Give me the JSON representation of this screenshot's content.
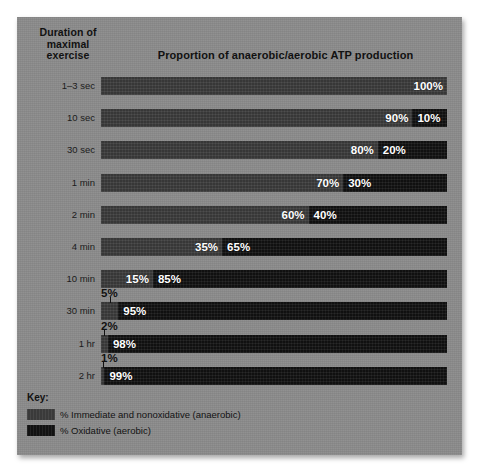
{
  "headings": {
    "duration": "Duration of\nmaximal\nexercise",
    "title": "Proportion of anaerobic/aerobic ATP production"
  },
  "legend": {
    "title": "Key:",
    "items": [
      {
        "swatch": "anaerobic",
        "label": "% Immediate and nonoxidative (anaerobic)"
      },
      {
        "swatch": "aerobic",
        "label": "% Oxidative (aerobic)"
      }
    ]
  },
  "colors": {
    "panel_background": "#8b8b8b",
    "anaerobic": "#3d3d3d",
    "aerobic": "#141414",
    "value_text": "#ffffff",
    "label_text": "#1b1b1b"
  },
  "chart_data": {
    "type": "bar",
    "orientation": "horizontal",
    "stacked": true,
    "title": "Proportion of anaerobic/aerobic ATP production",
    "xlabel": "",
    "ylabel": "Duration of maximal exercise",
    "xlim": [
      0,
      100
    ],
    "grid": false,
    "legend_position": "bottom-left",
    "categories": [
      "1–3 sec",
      "10 sec",
      "30 sec",
      "1 min",
      "2 min",
      "4 min",
      "10 min",
      "30 min",
      "1 hr",
      "2 hr"
    ],
    "series": [
      {
        "name": "% Immediate and nonoxidative (anaerobic)",
        "color": "#3d3d3d",
        "values": [
          100,
          90,
          80,
          70,
          60,
          35,
          15,
          5,
          2,
          1
        ]
      },
      {
        "name": "% Oxidative (aerobic)",
        "color": "#141414",
        "values": [
          0,
          10,
          20,
          30,
          40,
          65,
          85,
          95,
          98,
          99
        ]
      }
    ],
    "rows": [
      {
        "category": "1–3 sec",
        "anaerobic": 100,
        "aerobic": 0,
        "anaerobic_label": "100%",
        "aerobic_label": "",
        "callout": null
      },
      {
        "category": "10 sec",
        "anaerobic": 90,
        "aerobic": 10,
        "anaerobic_label": "90%",
        "aerobic_label": "10%",
        "callout": null
      },
      {
        "category": "30 sec",
        "anaerobic": 80,
        "aerobic": 20,
        "anaerobic_label": "80%",
        "aerobic_label": "20%",
        "callout": null
      },
      {
        "category": "1 min",
        "anaerobic": 70,
        "aerobic": 30,
        "anaerobic_label": "70%",
        "aerobic_label": "30%",
        "callout": null
      },
      {
        "category": "2 min",
        "anaerobic": 60,
        "aerobic": 40,
        "anaerobic_label": "60%",
        "aerobic_label": "40%",
        "callout": null
      },
      {
        "category": "4 min",
        "anaerobic": 35,
        "aerobic": 65,
        "anaerobic_label": "35%",
        "aerobic_label": "65%",
        "callout": null
      },
      {
        "category": "10 min",
        "anaerobic": 15,
        "aerobic": 85,
        "anaerobic_label": "15%",
        "aerobic_label": "85%",
        "callout": null
      },
      {
        "category": "30 min",
        "anaerobic": 5,
        "aerobic": 95,
        "anaerobic_label": "",
        "aerobic_label": "95%",
        "callout": "5%"
      },
      {
        "category": "1 hr",
        "anaerobic": 2,
        "aerobic": 98,
        "anaerobic_label": "",
        "aerobic_label": "98%",
        "callout": "2%"
      },
      {
        "category": "2 hr",
        "anaerobic": 1,
        "aerobic": 99,
        "anaerobic_label": "",
        "aerobic_label": "99%",
        "callout": "1%"
      }
    ]
  }
}
